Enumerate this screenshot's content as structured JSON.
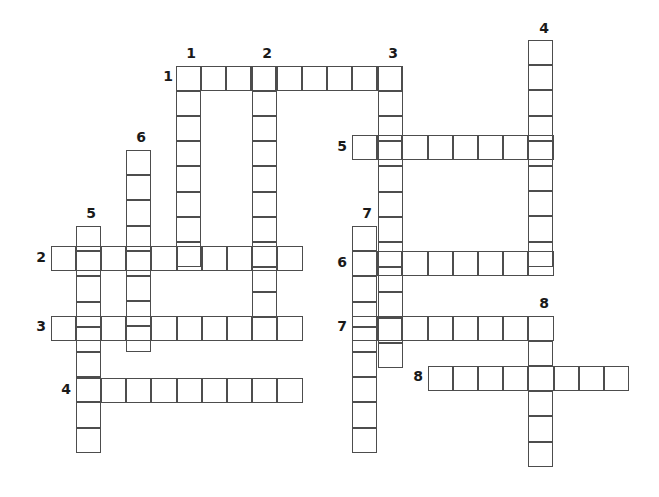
{
  "puzzle": {
    "title": "Crossword Puzzle Grid",
    "cell_size": 25.2,
    "origin_x": 50.6,
    "origin_y": 65.6,
    "grid_line_color": "#4d4d4d",
    "background_color": "#ffffff",
    "number_color": "#1a1a1a",
    "across_label": "Across",
    "down_label": "Down",
    "entries": [
      {
        "id": "across-1",
        "number": "1",
        "direction": "across",
        "length": 9,
        "x": 175.6,
        "y": 65.6,
        "number_x": 159.0,
        "number_y": 69.0,
        "label_x": 185.0,
        "label_y": 46.0
      },
      {
        "id": "across-2",
        "number": "2",
        "direction": "across",
        "length": 10,
        "x": 50.6,
        "y": 246.0,
        "number_x": 32.0,
        "number_y": 250.0,
        "label_x": 0,
        "label_y": 0
      },
      {
        "id": "across-3",
        "number": "3",
        "direction": "across",
        "length": 10,
        "x": 50.6,
        "y": 315.6,
        "number_x": 32.0,
        "number_y": 319.0,
        "label_x": 0,
        "label_y": 0
      },
      {
        "id": "across-4",
        "number": "4",
        "direction": "across",
        "length": 9,
        "x": 75.8,
        "y": 378.0,
        "number_x": 57.0,
        "number_y": 382.0,
        "label_x": 0,
        "label_y": 0
      },
      {
        "id": "across-5",
        "number": "5",
        "direction": "across",
        "length": 8,
        "x": 352.0,
        "y": 135.0,
        "number_x": 333.0,
        "number_y": 139.0,
        "label_x": 0,
        "label_y": 0
      },
      {
        "id": "across-6",
        "number": "6",
        "direction": "across",
        "length": 8,
        "x": 352.0,
        "y": 251.0,
        "number_x": 333.0,
        "number_y": 255.0,
        "label_x": 0,
        "label_y": 0
      },
      {
        "id": "across-7",
        "number": "7",
        "direction": "across",
        "length": 8,
        "x": 352.0,
        "y": 315.6,
        "number_x": 333.0,
        "number_y": 319.0,
        "label_x": 0,
        "label_y": 0
      },
      {
        "id": "across-8",
        "number": "8",
        "direction": "across",
        "length": 8,
        "x": 427.6,
        "y": 365.6,
        "number_x": 409.0,
        "number_y": 369.0,
        "label_x": 0,
        "label_y": 0
      },
      {
        "id": "down-1",
        "number": "1",
        "direction": "down",
        "length": 8,
        "x": 175.6,
        "y": 65.6,
        "number_x": 182.0,
        "number_y": 46.0
      },
      {
        "id": "down-2",
        "number": "2",
        "direction": "down",
        "length": 10,
        "x": 251.6,
        "y": 65.6,
        "number_x": 258.0,
        "number_y": 46.0
      },
      {
        "id": "down-3",
        "number": "3",
        "direction": "down",
        "length": 12,
        "x": 377.6,
        "y": 65.6,
        "number_x": 384.0,
        "number_y": 46.0
      },
      {
        "id": "down-4",
        "number": "4",
        "direction": "down",
        "length": 9,
        "x": 528.0,
        "y": 40.0,
        "number_x": 535.0,
        "number_y": 21.0
      },
      {
        "id": "down-5",
        "number": "5",
        "direction": "down",
        "length": 9,
        "x": 75.8,
        "y": 226.0,
        "number_x": 82.0,
        "number_y": 206.0
      },
      {
        "id": "down-6",
        "number": "6",
        "direction": "down",
        "length": 8,
        "x": 126.0,
        "y": 150.0,
        "number_x": 132.0,
        "number_y": 130.0
      },
      {
        "id": "down-7",
        "number": "7",
        "direction": "down",
        "length": 9,
        "x": 352.0,
        "y": 226.0,
        "number_x": 358.0,
        "number_y": 206.0
      },
      {
        "id": "down-8",
        "number": "8",
        "direction": "down",
        "length": 6,
        "x": 528.0,
        "y": 315.6,
        "number_x": 535.0,
        "number_y": 296.0
      }
    ],
    "extra_cells": [
      {
        "id": "across1-tail",
        "x": 277.0,
        "y": 65.6,
        "w": 1,
        "h": 1
      }
    ]
  }
}
